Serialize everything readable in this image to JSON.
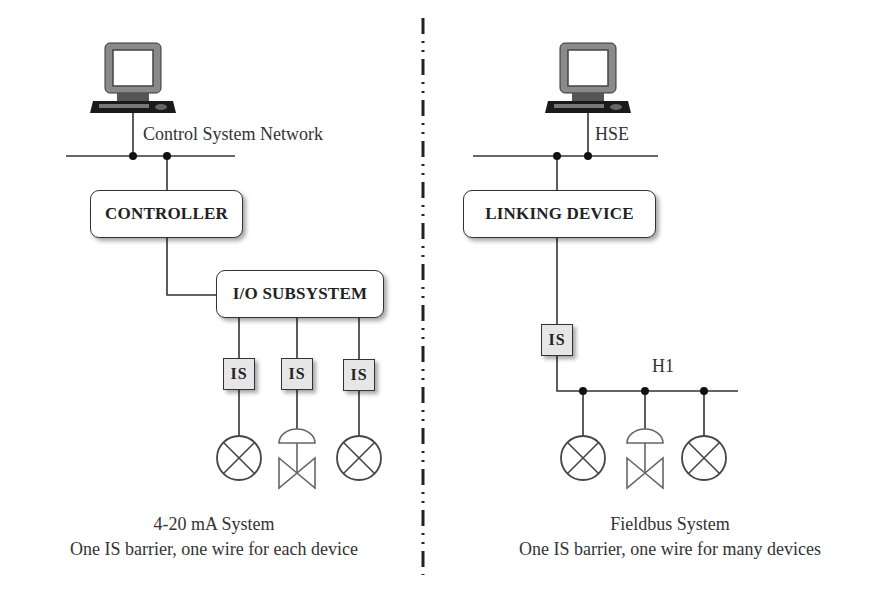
{
  "left_system": {
    "network_label": "Control System Network",
    "controller_label": "CONTROLLER",
    "io_label": "I/O SUBSYSTEM",
    "barriers": [
      "IS",
      "IS",
      "IS"
    ],
    "field_devices": [
      "instrument",
      "control-valve",
      "instrument"
    ],
    "caption_title": "4-20 mA System",
    "caption_sub": "One IS barrier, one wire for each  device"
  },
  "right_system": {
    "network_label": "HSE",
    "linking_label": "LINKING DEVICE",
    "barrier": "IS",
    "bus_label": "H1",
    "field_devices": [
      "instrument",
      "control-valve",
      "instrument"
    ],
    "caption_title": "Fieldbus System",
    "caption_sub": "One IS barrier, one wire for many devices"
  },
  "colors": {
    "line": "#333333",
    "barrier_fill": "#e6e6e6",
    "box_fill": "#ffffff"
  }
}
